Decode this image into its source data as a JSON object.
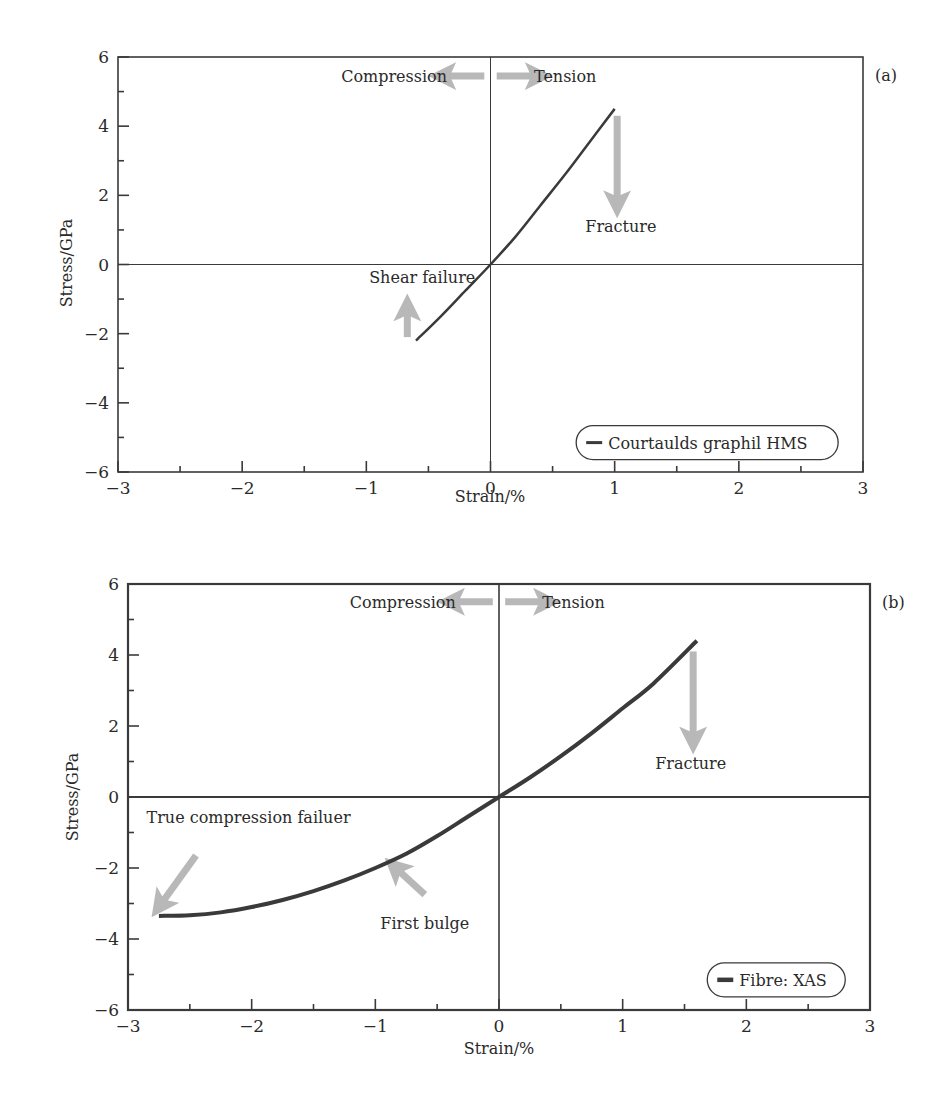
{
  "chart_data": [
    {
      "panel": "(a)",
      "type": "line",
      "title": "",
      "xlabel": "Strain/%",
      "ylabel": "Stress/GPa",
      "xlim": [
        -3,
        3
      ],
      "ylim": [
        -6,
        6
      ],
      "xticks": [
        -3,
        -2,
        -1,
        0,
        1,
        2,
        3
      ],
      "xtick_labels": [
        "−3",
        "−2",
        "−1",
        "0",
        "1",
        "2",
        "3"
      ],
      "yticks": [
        -6,
        -4,
        -2,
        0,
        2,
        4,
        6
      ],
      "ytick_labels": [
        "−6",
        "−4",
        "−2",
        "0",
        "2",
        "4",
        "6"
      ],
      "grid": false,
      "zero_lines": true,
      "legend": {
        "entries": [
          "Courtaulds graphil HMS"
        ],
        "position": "lower right"
      },
      "series": [
        {
          "name": "Courtaulds graphil HMS",
          "color": "#3a3a3a",
          "line_width": 2.5,
          "x": [
            -0.6,
            -0.4,
            -0.2,
            0.0,
            0.2,
            0.4,
            0.6,
            0.8,
            1.0
          ],
          "y": [
            -2.2,
            -1.5,
            -0.75,
            0.0,
            0.8,
            1.7,
            2.6,
            3.55,
            4.5
          ]
        }
      ],
      "annotations": [
        {
          "text": "Compression",
          "x": -0.35,
          "y": 5.45,
          "anchor": "end"
        },
        {
          "text": "Tension",
          "x": 0.35,
          "y": 5.45,
          "anchor": "start"
        },
        {
          "text": "Fracture",
          "x": 1.05,
          "y": 1.1,
          "anchor": "middle"
        },
        {
          "text": "Shear failure",
          "x": -0.55,
          "y": -0.35,
          "anchor": "middle"
        }
      ],
      "arrows": [
        {
          "name": "compression-arrow",
          "x1": -0.05,
          "y1": 5.45,
          "x2": -0.4,
          "y2": 5.45
        },
        {
          "name": "tension-arrow",
          "x1": 0.05,
          "y1": 5.45,
          "x2": 0.4,
          "y2": 5.45
        },
        {
          "name": "fracture-arrow",
          "x1": 1.02,
          "y1": 4.3,
          "x2": 1.02,
          "y2": 1.7
        },
        {
          "name": "shear-failure-arrow",
          "x1": -0.67,
          "y1": -2.1,
          "x2": -0.67,
          "y2": -1.2
        }
      ]
    },
    {
      "panel": "(b)",
      "type": "line",
      "title": "",
      "xlabel": "Strain/%",
      "ylabel": "Stress/GPa",
      "xlim": [
        -3,
        3
      ],
      "ylim": [
        -6,
        6
      ],
      "xticks": [
        -3,
        -2,
        -1,
        0,
        1,
        2,
        3
      ],
      "xtick_labels": [
        "−3",
        "−2",
        "−1",
        "0",
        "1",
        "2",
        "3"
      ],
      "yticks": [
        -6,
        -4,
        -2,
        0,
        2,
        4,
        6
      ],
      "ytick_labels": [
        "−6",
        "−4",
        "−2",
        "0",
        "2",
        "4",
        "6"
      ],
      "grid": false,
      "zero_lines": true,
      "legend": {
        "entries": [
          "Fibre: XAS"
        ],
        "position": "lower right"
      },
      "series": [
        {
          "name": "Fibre: XAS",
          "color": "#3a3a3a",
          "line_width": 4,
          "x": [
            -2.75,
            -2.5,
            -2.25,
            -2.0,
            -1.75,
            -1.5,
            -1.25,
            -1.0,
            -0.75,
            -0.5,
            -0.25,
            0.0,
            0.25,
            0.5,
            0.75,
            1.0,
            1.25,
            1.6
          ],
          "y": [
            -3.35,
            -3.33,
            -3.25,
            -3.1,
            -2.9,
            -2.65,
            -2.35,
            -2.0,
            -1.6,
            -1.1,
            -0.55,
            0.0,
            0.55,
            1.15,
            1.8,
            2.5,
            3.2,
            4.4
          ]
        }
      ],
      "annotations": [
        {
          "text": "Compression",
          "x": -0.35,
          "y": 5.5,
          "anchor": "end"
        },
        {
          "text": "Tension",
          "x": 0.35,
          "y": 5.5,
          "anchor": "start"
        },
        {
          "text": "Fracture",
          "x": 1.55,
          "y": 0.95,
          "anchor": "middle"
        },
        {
          "text": "True compression failuer",
          "x": -2.85,
          "y": -0.55,
          "anchor": "start"
        },
        {
          "text": "First bulge",
          "x": -0.6,
          "y": -3.55,
          "anchor": "middle"
        }
      ],
      "arrows": [
        {
          "name": "compression-arrow",
          "x1": -0.05,
          "y1": 5.5,
          "x2": -0.4,
          "y2": 5.5
        },
        {
          "name": "tension-arrow",
          "x1": 0.05,
          "y1": 5.5,
          "x2": 0.4,
          "y2": 5.5
        },
        {
          "name": "fracture-arrow",
          "x1": 1.57,
          "y1": 4.1,
          "x2": 1.57,
          "y2": 1.55
        },
        {
          "name": "true-compression-failure-arrow",
          "x1": -2.45,
          "y1": -1.65,
          "x2": -2.75,
          "y2": -3.1
        },
        {
          "name": "first-bulge-arrow",
          "x1": -0.6,
          "y1": -2.75,
          "x2": -0.85,
          "y2": -1.95
        }
      ]
    }
  ]
}
